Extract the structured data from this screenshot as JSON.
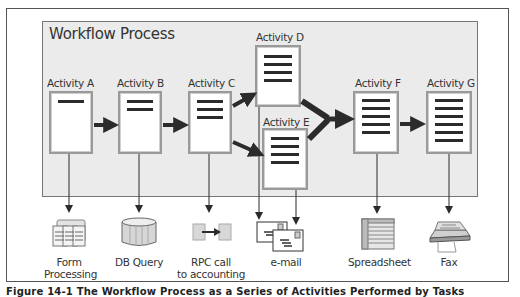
{
  "diagram": {
    "panel_title": "Workflow Process",
    "activities": [
      {
        "id": "A",
        "label": "Activity A",
        "bars": 1
      },
      {
        "id": "B",
        "label": "Activity B",
        "bars": 2
      },
      {
        "id": "C",
        "label": "Activity C",
        "bars": 3
      },
      {
        "id": "D",
        "label": "Activity D",
        "bars": 4
      },
      {
        "id": "E",
        "label": "Activity E",
        "bars": 4
      },
      {
        "id": "F",
        "label": "Activity F",
        "bars": 5
      },
      {
        "id": "G",
        "label": "Activity G",
        "bars": 6
      }
    ],
    "flows": [
      {
        "from": "A",
        "to": "B"
      },
      {
        "from": "B",
        "to": "C"
      },
      {
        "from": "C",
        "to": "D"
      },
      {
        "from": "C",
        "to": "E"
      },
      {
        "from": "D",
        "to": "F"
      },
      {
        "from": "E",
        "to": "F"
      },
      {
        "from": "F",
        "to": "G"
      }
    ],
    "outputs": [
      {
        "from": "A",
        "icon": "form-processing-icon",
        "line1": "Form",
        "line2": "Processing"
      },
      {
        "from": "B",
        "icon": "database-icon",
        "line1": "DB Query",
        "line2": ""
      },
      {
        "from": "C",
        "icon": "rpc-call-icon",
        "line1": "RPC call",
        "line2": "to accounting"
      },
      {
        "from": "D,E",
        "icon": "email-icon",
        "line1": "e-mail",
        "line2": ""
      },
      {
        "from": "F",
        "icon": "spreadsheet-icon",
        "line1": "Spreadsheet",
        "line2": ""
      },
      {
        "from": "G",
        "icon": "fax-icon",
        "line1": "Fax",
        "line2": ""
      }
    ],
    "caption": "Figure 14-1  The Workflow Process as a Series of Activities Performed by Tasks"
  },
  "colors": {
    "panel_bg": "#ebebeb",
    "box_border": "#9a9a9a",
    "arrow": "#2b2b2b",
    "frame_border": "#555555"
  }
}
